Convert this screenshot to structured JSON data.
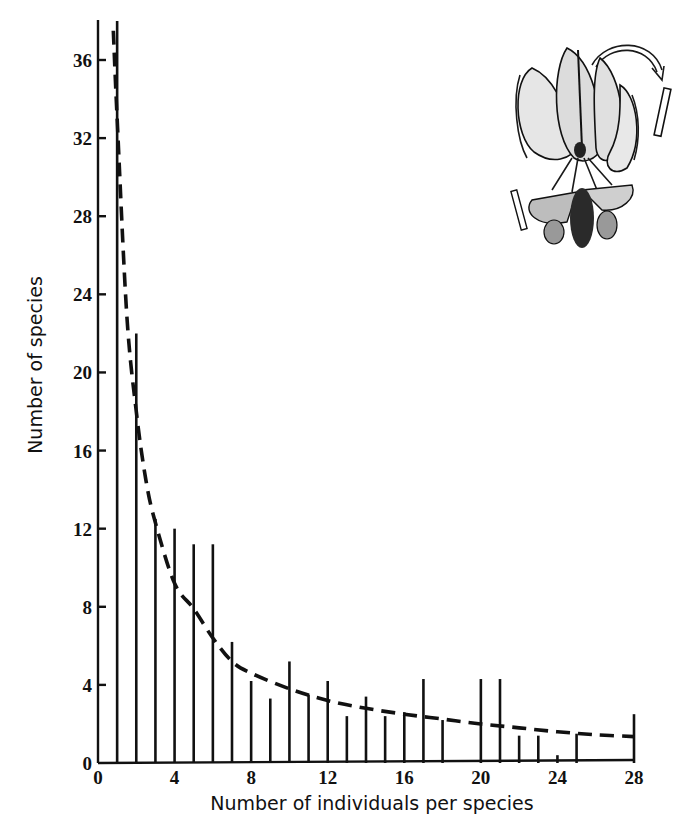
{
  "chart_data": {
    "type": "bar",
    "title": "",
    "xlabel": "Number of individuals per species",
    "ylabel": "Number of species",
    "xlim": [
      0,
      28
    ],
    "ylim": [
      0,
      38
    ],
    "x_ticks": [
      0,
      4,
      8,
      12,
      16,
      20,
      24,
      28
    ],
    "y_ticks": [
      0,
      4,
      8,
      12,
      16,
      20,
      24,
      28,
      32,
      36
    ],
    "grid": false,
    "legend": null,
    "bars": {
      "x": [
        1,
        2,
        3,
        4,
        5,
        6,
        7,
        8,
        9,
        10,
        11,
        12,
        13,
        14,
        15,
        16,
        17,
        18,
        20,
        21,
        22,
        23,
        24,
        25,
        28
      ],
      "values": [
        38,
        22,
        12.5,
        12,
        11.2,
        11.2,
        6.2,
        4.2,
        3.3,
        5.2,
        3.5,
        4.2,
        2.4,
        3.4,
        2.4,
        2.6,
        4.3,
        2.2,
        4.3,
        4.3,
        1.4,
        1.4,
        0.4,
        1.5,
        2.5
      ]
    },
    "series": [
      {
        "name": "Fitted curve (dashed)",
        "type": "line",
        "style": "dashed",
        "x": [
          0.8,
          1,
          1.5,
          2,
          2.5,
          3,
          4,
          5,
          6,
          7,
          8,
          10,
          12,
          14,
          16,
          18,
          20,
          22,
          24,
          26,
          28
        ],
        "values": [
          37.5,
          33,
          23,
          18,
          14.5,
          12.3,
          9.2,
          7.9,
          6.4,
          5.2,
          4.6,
          3.8,
          3.2,
          2.8,
          2.5,
          2.25,
          2.0,
          1.8,
          1.6,
          1.45,
          1.35
        ]
      }
    ],
    "annotations": [
      "Illustration of a lily flower being visited by a hawk moth (top right)"
    ]
  },
  "axes": {
    "x_title": "Number of individuals per species",
    "y_title": "Number of species",
    "x_tick_labels": [
      "0",
      "4",
      "8",
      "12",
      "16",
      "20",
      "24",
      "28"
    ],
    "y_tick_labels": [
      "0",
      "4",
      "8",
      "12",
      "16",
      "20",
      "24",
      "28",
      "32",
      "36"
    ]
  },
  "illustration": {
    "subject": "lily-flower-with-hawk-moth"
  }
}
